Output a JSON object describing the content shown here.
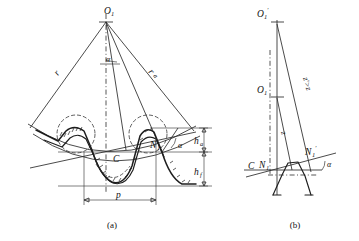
{
  "figure": {
    "title_visible": false,
    "background_color": "#ffffff",
    "line_color": "#1e1e1e",
    "panels": [
      {
        "id": "a",
        "caption": "(a)",
        "labels": {
          "apex": "O",
          "apex_sub": "1",
          "radius_left": "r",
          "radius_right": "r",
          "radius_right_sub": "a",
          "half_angle": "α",
          "pressure_angle": "α",
          "pitch_point": "C",
          "contact_point": "N",
          "contact_point_sub": "1",
          "addendum": "h",
          "addendum_sub": "a",
          "dedendum": "h",
          "dedendum_sub": "f",
          "pitch": "p"
        }
      },
      {
        "id": "b",
        "caption": "(b)",
        "labels": {
          "apex_upper": "O",
          "apex_upper_sub": "1",
          "apex_upper_prime": "′",
          "apex_lower": "O",
          "apex_lower_sub": "1",
          "tooth_count_compare": "z′>z",
          "tooth_count": "z",
          "pitch_point": "C",
          "contact_point": "N",
          "contact_point_sub": "1",
          "contact_point_prime": "N",
          "contact_point_prime_sub": "1",
          "contact_point_prime_mark": "′",
          "pressure_angle": "α"
        }
      }
    ]
  }
}
